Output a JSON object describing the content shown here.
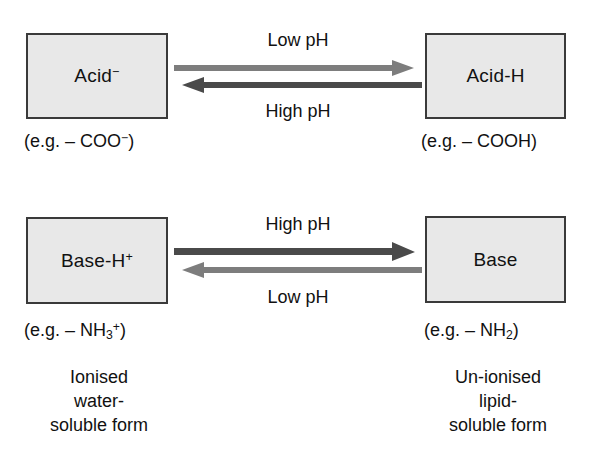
{
  "diagram": {
    "colors": {
      "box_fill": "#e8e8e8",
      "box_border": "#3a3a3a",
      "arrow_light": "#7d7d7d",
      "arrow_dark": "#4a4a4a",
      "text": "#111111",
      "background": "#ffffff"
    },
    "rows": [
      {
        "id": "acid-row",
        "left_box": {
          "label_html": "Acid<sup>−</sup>",
          "label_text": "Acid−",
          "caption_html": "(e.g. – COO<sup>−</sup>)",
          "caption_text": "(e.g. – COO−)"
        },
        "right_box": {
          "label_html": "Acid-H",
          "label_text": "Acid-H",
          "caption_html": "(e.g. – COOH)",
          "caption_text": "(e.g. – COOH)"
        },
        "forward_arrow": {
          "label": "Low pH",
          "direction": "right",
          "weight": "light",
          "color": "#7d7d7d"
        },
        "reverse_arrow": {
          "label": "High pH",
          "direction": "left",
          "weight": "dark",
          "color": "#4a4a4a"
        }
      },
      {
        "id": "base-row",
        "left_box": {
          "label_html": "Base-H<sup>+</sup>",
          "label_text": "Base-H+",
          "caption_html": "(e.g. – NH<sub>3</sub><sup>+</sup>)",
          "caption_text": "(e.g. – NH3+)",
          "descriptor_lines": [
            "Ionised",
            "water-",
            "soluble form"
          ]
        },
        "right_box": {
          "label_html": "Base",
          "label_text": "Base",
          "caption_html": "(e.g. – NH<sub>2</sub>)",
          "caption_text": "(e.g. – NH2)",
          "descriptor_lines": [
            "Un-ionised",
            "lipid-",
            "soluble form"
          ]
        },
        "forward_arrow": {
          "label": "High pH",
          "direction": "right",
          "weight": "dark",
          "color": "#4a4a4a"
        },
        "reverse_arrow": {
          "label": "Low pH",
          "direction": "left",
          "weight": "light",
          "color": "#7d7d7d"
        }
      }
    ]
  }
}
